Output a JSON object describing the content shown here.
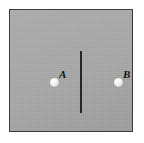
{
  "figure": {
    "background_color": "#ffffff",
    "panel": {
      "fill_color": "#a9a9a9",
      "border_color": "#3a3a3a"
    },
    "divider": {
      "name": "vertical-divider-line",
      "color": "#262626",
      "orientation": "vertical"
    },
    "markers": [
      {
        "id": "a",
        "label": "A",
        "side": "left",
        "fill_color": "#ffffff",
        "shape": "circle"
      },
      {
        "id": "b",
        "label": "B",
        "side": "right",
        "fill_color": "#ffffff",
        "shape": "circle"
      }
    ]
  }
}
